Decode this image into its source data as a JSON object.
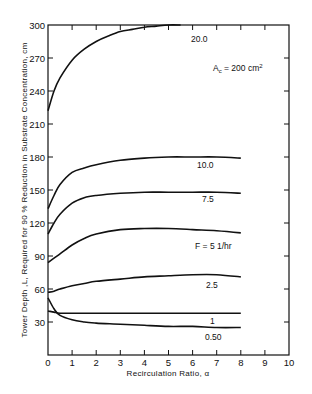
{
  "chart_data": {
    "type": "line",
    "title": "",
    "xlabel": "Recirculation Ratio, α",
    "ylabel": "Tower Depth, L, Required for 90% Reduction in Substrate Concentration, cm",
    "xlim": [
      0,
      10
    ],
    "ylim": [
      0,
      300
    ],
    "xticks": [
      0,
      1,
      2,
      3,
      4,
      5,
      6,
      7,
      8,
      9,
      10
    ],
    "yticks": [
      30,
      60,
      90,
      120,
      150,
      180,
      210,
      240,
      270,
      300
    ],
    "grid": false,
    "legend": "inline curve labels",
    "annotation": "A_c = 200 cm²",
    "x": [
      0,
      0.25,
      0.5,
      1,
      1.5,
      2,
      3,
      4,
      5,
      6,
      7,
      8
    ],
    "series": [
      {
        "name": "20.0",
        "x": [
          0,
          0.25,
          0.5,
          1,
          1.5,
          2,
          2.5,
          3,
          3.5,
          4,
          4.5,
          5,
          5.5
        ],
        "values": [
          222,
          240,
          252,
          268,
          278,
          285,
          290,
          294,
          296,
          298,
          299,
          300,
          300
        ],
        "label": "20.0"
      },
      {
        "name": "10.0",
        "values": [
          133,
          145,
          155,
          166,
          170,
          173,
          177,
          179,
          180,
          180,
          180,
          179
        ],
        "label": "10.0"
      },
      {
        "name": "7.5",
        "values": [
          110,
          120,
          128,
          138,
          143,
          145,
          147,
          148,
          148,
          148,
          148,
          147
        ],
        "label": "7.5"
      },
      {
        "name": "5",
        "values": [
          84,
          88,
          92,
          100,
          106,
          110,
          114,
          115,
          115,
          114,
          113,
          111
        ],
        "label": "F = 5 1/hr"
      },
      {
        "name": "2.5",
        "values": [
          57,
          58,
          60,
          63,
          65,
          67,
          69,
          71,
          72,
          73,
          73,
          71
        ],
        "label": "2.5"
      },
      {
        "name": "1",
        "values": [
          40,
          39,
          38,
          38,
          38,
          38,
          38,
          38,
          38,
          38,
          38,
          38
        ],
        "label": "1"
      },
      {
        "name": "0.50",
        "values": [
          52,
          42,
          36,
          32,
          30,
          29,
          28,
          27,
          26,
          26,
          25,
          25
        ],
        "label": "0.50"
      }
    ]
  },
  "labels": {
    "xlabel": "Recirculation Ratio, α",
    "ylabel": "Tower Depth ,L, Required for 90 % Reduction in Substrate Concentration, cm",
    "annotation_main": "A",
    "annotation_sub": "c",
    "annotation_rest": " = 200 cm",
    "annotation_sup": "2",
    "curve_20": "20.0",
    "curve_10": "10.0",
    "curve_7_5": "7.5",
    "curve_5": "F = 5  1/hr",
    "curve_2_5": "2.5",
    "curve_1": "1",
    "curve_0_5": "0.50"
  }
}
